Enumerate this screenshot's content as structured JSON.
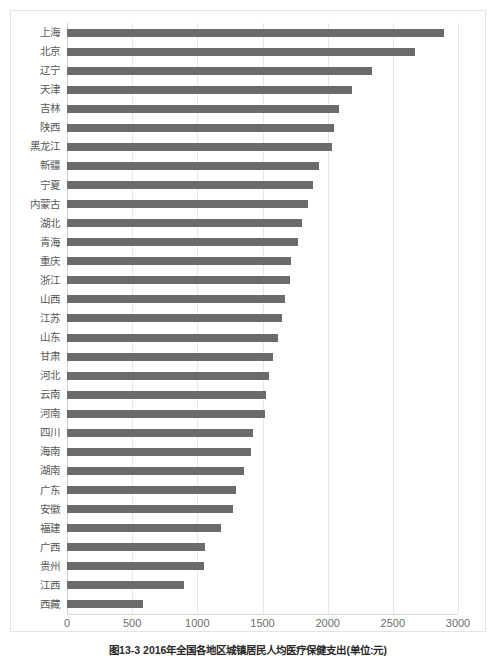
{
  "figure": {
    "caption": "图13-3  2016年全国各地区城镇居民人均医疗保健支出(单位:元)",
    "border_color": "#e3e3e3"
  },
  "chart_data": {
    "type": "bar",
    "orientation": "horizontal",
    "title": "",
    "subtitle": "",
    "xlabel": "",
    "ylabel": "",
    "xlim": [
      0,
      3000
    ],
    "ylim": null,
    "grid": "vertical",
    "legend": null,
    "bar_color": "#6b6b6b",
    "xticks": [
      0,
      500,
      1000,
      1500,
      2000,
      2500,
      3000
    ],
    "xtick_labels": [
      "0",
      "500",
      "1000",
      "1500",
      "2000",
      "2500",
      "3000"
    ],
    "categories": [
      "上海",
      "北京",
      "辽宁",
      "天津",
      "吉林",
      "陕西",
      "黑龙江",
      "新疆",
      "宁夏",
      "内蒙古",
      "湖北",
      "青海",
      "重庆",
      "浙江",
      "山西",
      "江苏",
      "山东",
      "甘肃",
      "河北",
      "云南",
      "河南",
      "四川",
      "海南",
      "湖南",
      "广东",
      "安徽",
      "福建",
      "广西",
      "贵州",
      "江西",
      "西藏"
    ],
    "values": [
      2890,
      2670,
      2340,
      2190,
      2090,
      2050,
      2030,
      1930,
      1890,
      1850,
      1800,
      1770,
      1720,
      1710,
      1670,
      1650,
      1620,
      1580,
      1550,
      1530,
      1520,
      1430,
      1410,
      1360,
      1300,
      1270,
      1180,
      1060,
      1050,
      900,
      580
    ]
  }
}
